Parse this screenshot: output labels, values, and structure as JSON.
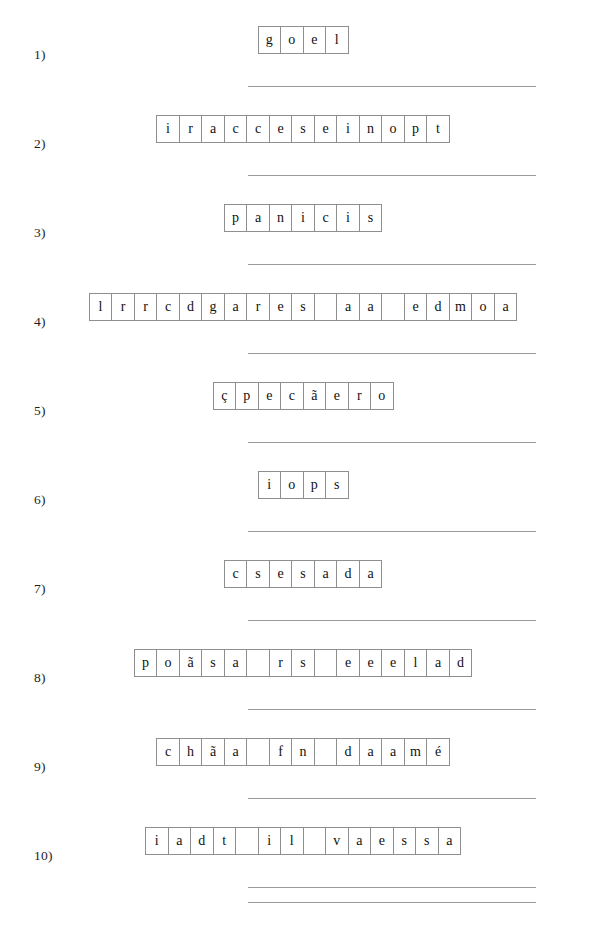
{
  "document": {
    "type": "letter-tile-worksheet",
    "ink_color": "#111111",
    "tile_border_color": "#8e8e8e",
    "separator_color": "#9a9a9a",
    "background_color": "#ffffff"
  },
  "rows": [
    {
      "index_label": "1)",
      "letters": [
        "g",
        "o",
        "e",
        "l"
      ]
    },
    {
      "index_label": "2)",
      "letters": [
        "i",
        "r",
        "a",
        "c",
        "c",
        "e",
        "s",
        "e",
        "i",
        "n",
        "o",
        "p",
        "t"
      ]
    },
    {
      "index_label": "3)",
      "letters": [
        "p",
        "a",
        "n",
        "i",
        "c",
        "i",
        "s"
      ]
    },
    {
      "index_label": "4)",
      "letters": [
        "l",
        "r",
        "r",
        "c",
        "d",
        "g",
        "a",
        "r",
        "e",
        "s",
        " ",
        "a",
        "a",
        " ",
        "e",
        "d",
        "m",
        "o",
        "a"
      ]
    },
    {
      "index_label": "5)",
      "letters": [
        "ç",
        "p",
        "e",
        "c",
        "ã",
        "e",
        "r",
        "o"
      ]
    },
    {
      "index_label": "6)",
      "letters": [
        "i",
        "o",
        "p",
        "s"
      ]
    },
    {
      "index_label": "7)",
      "letters": [
        "c",
        "s",
        "e",
        "s",
        "a",
        "d",
        "a"
      ]
    },
    {
      "index_label": "8)",
      "letters": [
        "p",
        "o",
        "ã",
        "s",
        "a",
        " ",
        "r",
        "s",
        " ",
        "e",
        "e",
        "e",
        "l",
        "a",
        "d"
      ]
    },
    {
      "index_label": "9)",
      "letters": [
        "c",
        "h",
        "ã",
        "a",
        " ",
        "f",
        "n",
        " ",
        "d",
        "a",
        "a",
        "m",
        "é"
      ]
    },
    {
      "index_label": "10)",
      "letters": [
        "i",
        "a",
        "d",
        "t",
        " ",
        "i",
        "l",
        " ",
        "v",
        "a",
        "e",
        "s",
        "s",
        "a"
      ]
    }
  ]
}
